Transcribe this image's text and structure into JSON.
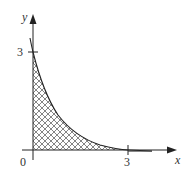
{
  "diagram": {
    "type": "region-under-curve",
    "x_axis": {
      "label": "x",
      "tick_value": "3"
    },
    "y_axis": {
      "label": "y",
      "tick_value": "3"
    },
    "origin_label": "0",
    "curve": {
      "description": "decreasing curve from (0,3) approaching the x-axis near x=3",
      "points": [
        [
          0,
          3.4
        ],
        [
          0,
          3
        ],
        [
          0.4,
          1.85
        ],
        [
          0.7,
          1.2
        ],
        [
          1.0,
          0.78
        ],
        [
          1.5,
          0.36
        ],
        [
          2.0,
          0.12
        ],
        [
          3.0,
          0.0
        ],
        [
          3.7,
          0.0
        ]
      ]
    },
    "shaded_region": {
      "pattern": "crosshatch",
      "bounds": "between curve, x-axis and y-axis from x=0 to x=3"
    },
    "colors": {
      "line": "#222222",
      "hatch": "#555555",
      "background": "#ffffff"
    }
  }
}
